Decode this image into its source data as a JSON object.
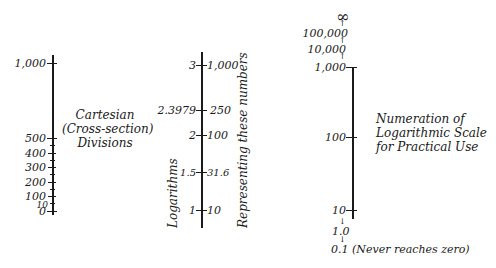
{
  "cartesian_scale": {
    "caption_lines": [
      "Cartesian",
      "(Cross-section)",
      "Divisions"
    ],
    "labels": [
      "1,000",
      "500",
      "400",
      "300",
      "200",
      "100",
      "10",
      "0"
    ],
    "values": [
      1000,
      500,
      400,
      300,
      200,
      100,
      10,
      0
    ],
    "minor_tick_step": 50
  },
  "log_scale": {
    "left_caption": "Logarithms",
    "right_caption": "Representing these numbers",
    "rows": [
      {
        "log": "3",
        "number": "1,000"
      },
      {
        "log": "2.3979",
        "number": "250"
      },
      {
        "log": "2",
        "number": "100"
      },
      {
        "log": "1.5",
        "number": "31.6"
      },
      {
        "log": "1",
        "number": "10"
      }
    ]
  },
  "practical_scale": {
    "caption_lines": [
      "Numeration of",
      "Logarithmic Scale",
      "for Practical Use"
    ],
    "above_axis": [
      "∞",
      "100,000",
      "10,000"
    ],
    "axis_labels": [
      "1,000",
      "100",
      "10"
    ],
    "below_axis": [
      "1.0",
      "0.1"
    ],
    "note": "(Never reaches zero)"
  }
}
